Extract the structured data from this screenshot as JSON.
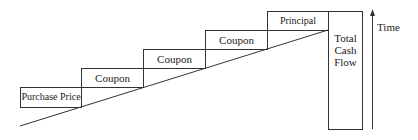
{
  "diagram": {
    "type": "staircase-cash-flow",
    "steps": [
      {
        "label": "Purchase Price"
      },
      {
        "label": "Coupon"
      },
      {
        "label": "Coupon"
      },
      {
        "label": "Coupon"
      },
      {
        "label": "Principal"
      }
    ],
    "total": {
      "line1": "Total",
      "line2": "Cash",
      "line3": "Flow"
    },
    "axis": {
      "label": "Time"
    },
    "colors": {
      "line": "#333333",
      "text": "#222222",
      "background": "#ffffff"
    }
  }
}
